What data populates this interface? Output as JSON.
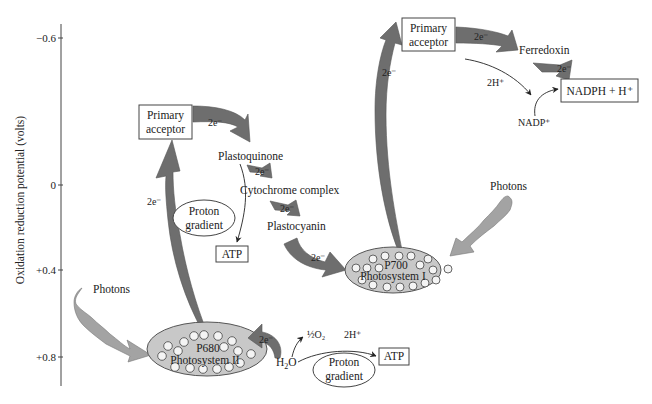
{
  "axis": {
    "label": "Oxidation reduction potential (volts)",
    "ticks": [
      {
        "label": "−0.6",
        "y": 38
      },
      {
        "label": "0",
        "y": 185
      },
      {
        "label": "+0.4",
        "y": 270
      },
      {
        "label": "+0.8",
        "y": 357
      }
    ]
  },
  "photosystem2": {
    "name": "P680",
    "label": "Photosystem II",
    "primary_acceptor": "Primary acceptor",
    "primary_acceptor_line1": "Primary",
    "primary_acceptor_line2": "acceptor",
    "photons": "Photons",
    "electron_label": "2e⁻"
  },
  "photosystem1": {
    "name": "P700",
    "label": "Photosystem I",
    "primary_acceptor_line1": "Primary",
    "primary_acceptor_line2": "acceptor",
    "photons": "Photons",
    "electron_label": "2e⁻"
  },
  "chain": {
    "plastoquinone": "Plastoquinone",
    "cytochrome": "Cytochrome complex",
    "plastocyanin": "Plastocyanin",
    "ferredoxin": "Ferredoxin",
    "e_label": "2e⁻"
  },
  "proton_gradient_upper": {
    "line1": "Proton",
    "line2": "gradient",
    "product": "ATP"
  },
  "proton_gradient_lower": {
    "line1": "Proton",
    "line2": "gradient",
    "product": "ATP"
  },
  "water_split": {
    "water": "H₂O",
    "water_main": "H",
    "water_sub": "2",
    "water_end": "O",
    "oxygen": "½O₂",
    "protons": "2H⁺"
  },
  "nadph": {
    "product": "NADPH + H⁺",
    "reactant": "NADP⁺",
    "protons": "2H⁺"
  },
  "colors": {
    "dark_arrow": "#6e6e6e",
    "light_arrow": "#a3a3a3",
    "photosystem_fill": "#c8c8c8"
  }
}
